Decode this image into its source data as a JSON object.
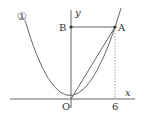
{
  "diagram": {
    "type": "coordinate-graph",
    "curve_label": "①",
    "axes": {
      "x_label": "x",
      "y_label": "y",
      "origin_label": "O"
    },
    "points": [
      {
        "name": "A",
        "x": 6
      },
      {
        "name": "B"
      },
      {
        "name": "O"
      }
    ],
    "tick_labels": {
      "x": "6"
    },
    "segments": [
      "B-A",
      "O-A"
    ],
    "dashed_guides": [
      "A to x=6 on x-axis"
    ],
    "colors": {
      "line": "#555555",
      "text": "#333333",
      "background": "#ffffff"
    }
  }
}
